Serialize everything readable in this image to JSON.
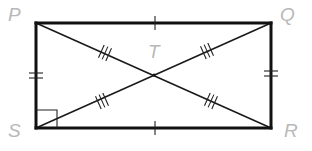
{
  "figure": {
    "type": "rectangle-with-diagonals",
    "colors": {
      "lines": "#111111",
      "labels": "#b8b8b8",
      "background": "#ffffff"
    },
    "vertices": {
      "P": {
        "label": "P",
        "x": 36,
        "y": 23
      },
      "Q": {
        "label": "Q",
        "x": 271,
        "y": 23
      },
      "R": {
        "label": "R",
        "x": 271,
        "y": 128
      },
      "S": {
        "label": "S",
        "x": 36,
        "y": 128
      }
    },
    "intersection": {
      "label": "T",
      "x": 154,
      "y": 75
    },
    "markings": {
      "PQ": "single tick",
      "SR": "single tick",
      "PS": "double tick",
      "QR": "double tick",
      "PT": "triple tick",
      "QT": "triple tick",
      "ST": "triple tick",
      "RT": "triple tick",
      "angle_S": "right angle"
    }
  }
}
